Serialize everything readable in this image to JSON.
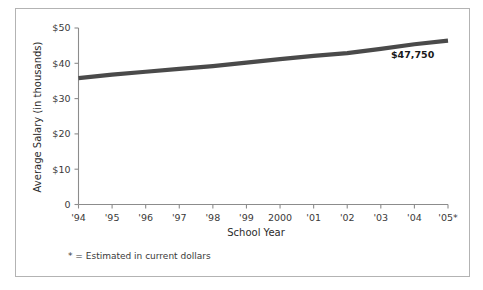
{
  "figure": {
    "border_color": "#b3b3b3",
    "background": "#ffffff"
  },
  "chart_data": {
    "type": "line",
    "title": "",
    "xlabel": "School Year",
    "ylabel": "Average Salary (in thousands)",
    "categories": [
      "'94",
      "'95",
      "'96",
      "'97",
      "'98",
      "'99",
      "2000",
      "'01",
      "'02",
      "'03",
      "'04",
      "'05*"
    ],
    "values": [
      35.8,
      36.8,
      37.6,
      38.4,
      39.2,
      40.2,
      41.2,
      42.1,
      42.9,
      44.1,
      45.4,
      46.4
    ],
    "ylim": [
      0,
      50
    ],
    "yticks": [
      0,
      10,
      20,
      30,
      40,
      50
    ],
    "ytick_labels": [
      "0",
      "$10",
      "$20",
      "$30",
      "$40",
      "$50"
    ],
    "grid": false,
    "legend": "none",
    "series_color": "#4a4a4a",
    "annotations": [
      {
        "text": "$47,750",
        "category": "'05*",
        "description": "value label at end of line"
      }
    ],
    "footnote": "* = Estimated in current dollars"
  },
  "axes": {
    "y_title": "Average Salary (in thousands)",
    "x_title": "School Year",
    "axis_color": "#8c8c8c"
  },
  "labels": {
    "end_value": "$47,750",
    "footnote": "* = Estimated in current dollars"
  }
}
